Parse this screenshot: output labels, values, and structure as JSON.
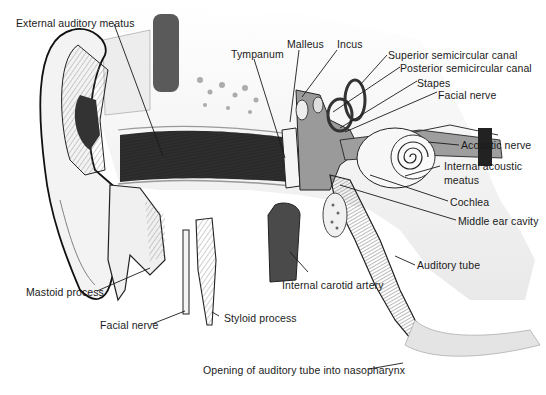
{
  "figure": {
    "colors": {
      "background": "#ffffff",
      "ink": "#1a1a1a",
      "bone": "#ececec",
      "canal_dark": "#3a3a3a",
      "vessel": "#4a4a4a",
      "tissue": "#bdbdbd"
    }
  },
  "labels": [
    {
      "id": "external-auditory-meatus",
      "text": "External auditory meatus"
    },
    {
      "id": "tympanum",
      "text": "Tympanum"
    },
    {
      "id": "malleus",
      "text": "Malleus"
    },
    {
      "id": "incus",
      "text": "Incus"
    },
    {
      "id": "superior-semicircular-canal",
      "text": "Superior semicircular canal"
    },
    {
      "id": "posterior-semicircular-canal",
      "text": "Posterior semicircular canal"
    },
    {
      "id": "stapes",
      "text": "Stapes"
    },
    {
      "id": "facial-nerve-upper",
      "text": "Facial nerve"
    },
    {
      "id": "acoustic-nerve",
      "text": "Acoustic nerve"
    },
    {
      "id": "internal-acoustic-meatus-line1",
      "text": "Internal acoustic"
    },
    {
      "id": "internal-acoustic-meatus-line2",
      "text": "meatus"
    },
    {
      "id": "cochlea",
      "text": "Cochlea"
    },
    {
      "id": "middle-ear-cavity",
      "text": "Middle ear cavity"
    },
    {
      "id": "auditory-tube",
      "text": "Auditory tube"
    },
    {
      "id": "internal-carotid-artery",
      "text": "Internal carotid artery"
    },
    {
      "id": "mastoid-process",
      "text": "Mastoid process"
    },
    {
      "id": "facial-nerve-lower",
      "text": "Facial nerve"
    },
    {
      "id": "styloid-process",
      "text": "Styloid process"
    },
    {
      "id": "opening-auditory-tube",
      "text": "Opening of auditory tube into nasopharynx"
    }
  ]
}
